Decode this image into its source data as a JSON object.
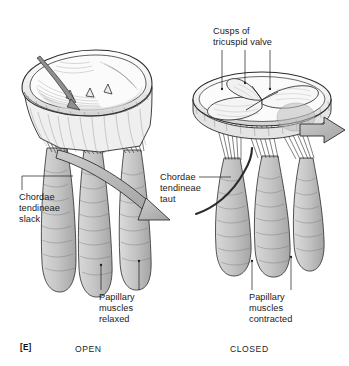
{
  "figure": {
    "panel_tag": "[E]"
  },
  "labels": {
    "cusps": "Cusps of\ntricuspid valve",
    "chordae_slack": "Chordae\ntendineae\nslack",
    "chordae_taut": "Chordae\ntendineae\ntaut",
    "papillary_relaxed": "Papillary\nmuscles\nrelaxed",
    "papillary_contracted": "Papillary\nmuscles\ncontracted"
  },
  "captions": {
    "left": "OPEN",
    "right": "CLOSED"
  },
  "colors": {
    "ink": "#1a1a1a",
    "line": "#2b2b2b",
    "muscle_fill": "#c9c9c9",
    "muscle_shadow": "#a9a9a9",
    "annulus_fill": "#f2f2f2",
    "cusp_fill": "#fafafa",
    "arrow_fill": "#b8b8b8",
    "background": "#ffffff"
  },
  "illustration": {
    "left_panel_name": "open-tricuspid-valve",
    "right_panel_name": "closed-tricuspid-valve",
    "left_arrow_name": "blood-inflow-arrow",
    "right_arrow_name": "blood-outflow-arrow"
  }
}
